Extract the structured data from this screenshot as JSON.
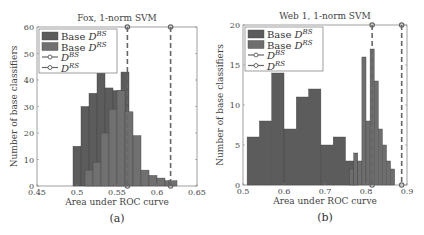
{
  "chart_data": [
    {
      "type": "bar",
      "title": "Fox, 1-norm SVM",
      "xlabel": "Area under ROC curve",
      "ylabel": "Number of base classifiers",
      "sublabel": "(a)",
      "xlim": [
        0.45,
        0.65
      ],
      "ylim": [
        0,
        60
      ],
      "xticks": [
        0.45,
        0.5,
        0.55,
        0.6,
        0.65
      ],
      "xtick_labels": [
        "0.45",
        "0.5",
        "0.55",
        "0.6",
        "0.65"
      ],
      "yticks": [
        0,
        10,
        20,
        30,
        40,
        50,
        60
      ],
      "bin_width": 0.01,
      "legend": [
        "Base D^BS",
        "Base D^RS",
        "D^BS",
        "D^RS"
      ],
      "legend_position": "upper left",
      "series": [
        {
          "name": "Base D^BS",
          "color": "#5c5c5c",
          "bins": [
            0.495,
            0.505,
            0.515,
            0.525,
            0.535,
            0.545,
            0.555
          ],
          "values": [
            15,
            30,
            35,
            43,
            37,
            36,
            43
          ]
        },
        {
          "name": "Base D^RS",
          "color": "#707070",
          "bins": [
            0.505,
            0.51,
            0.52,
            0.53,
            0.54,
            0.55,
            0.56,
            0.57,
            0.58,
            0.59,
            0.6,
            0.61,
            0.615
          ],
          "values": [
            0,
            6,
            9,
            20,
            29,
            36,
            28,
            19,
            6,
            4,
            3,
            2,
            2
          ]
        },
        {
          "name": "D^BS",
          "type": "vline",
          "x": 0.563,
          "color": "#666666"
        },
        {
          "name": "D^RS",
          "type": "vline",
          "x": 0.617,
          "color": "#666666"
        }
      ]
    },
    {
      "type": "bar",
      "title": "Web 1, 1-norm SVM",
      "xlabel": "Area under ROC curve",
      "ylabel": "Number of base classifiers",
      "sublabel": "(b)",
      "xlim": [
        0.5,
        0.9
      ],
      "ylim": [
        0,
        20
      ],
      "xticks": [
        0.5,
        0.6,
        0.7,
        0.8,
        0.9
      ],
      "xtick_labels": [
        "0.5",
        "0.6",
        "0.7",
        "0.8",
        "0.9"
      ],
      "yticks": [
        0,
        5,
        10,
        15,
        20
      ],
      "bin_width": 0.03,
      "legend": [
        "Base D^BS",
        "Base D^RS",
        "D^BS",
        "D^RS"
      ],
      "legend_position": "upper left",
      "series": [
        {
          "name": "Base D^BS",
          "color": "#5c5c5c",
          "bins": [
            0.51,
            0.54,
            0.57,
            0.6,
            0.63,
            0.66,
            0.69,
            0.72,
            0.75
          ],
          "values": [
            6,
            8,
            14,
            7,
            11,
            12,
            5,
            6,
            3
          ]
        },
        {
          "name": "Base D^RS",
          "color": "#6e6e6e",
          "bins": [
            0.76,
            0.775,
            0.79,
            0.805,
            0.82,
            0.835,
            0.85,
            0.865
          ],
          "values": [
            2,
            4,
            3,
            16,
            8,
            17,
            13,
            7,
            3,
            2
          ],
          "bins_full": [
            0.76,
            0.77,
            0.78,
            0.79,
            0.8,
            0.81,
            0.82,
            0.83,
            0.84,
            0.85,
            0.86,
            0.87
          ],
          "values_full": [
            2,
            4,
            3,
            16,
            8,
            17,
            13,
            7,
            5,
            3,
            2
          ]
        },
        {
          "name": "D^BS",
          "type": "vline",
          "x": 0.815,
          "color": "#666666"
        },
        {
          "name": "D^RS",
          "type": "vline",
          "x": 0.887,
          "color": "#666666"
        }
      ]
    }
  ],
  "panels": {
    "a": {
      "title": "Fox, 1-norm SVM",
      "xlabel": "Area under ROC curve",
      "ylabel": "Number of base classifiers",
      "sublabel": "(a)"
    },
    "b": {
      "title": "Web 1, 1-norm SVM",
      "xlabel": "Area under ROC curve",
      "ylabel": "Number of base classifiers",
      "sublabel": "(b)"
    }
  },
  "legend": {
    "base_label": "Base",
    "D": "D",
    "bs_sup": "BS",
    "rs_sup": "RS"
  }
}
